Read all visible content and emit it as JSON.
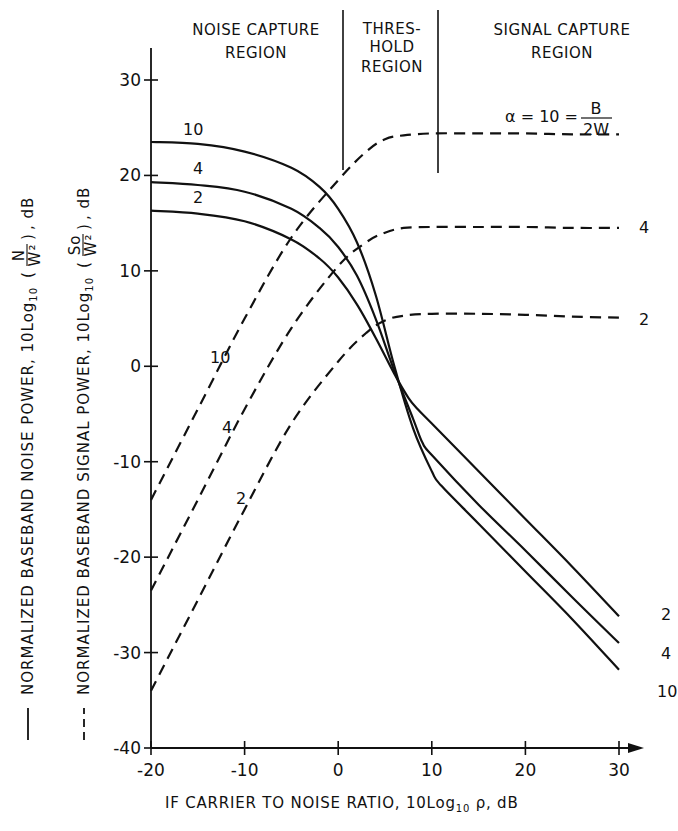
{
  "chart_data": {
    "type": "line",
    "title": "",
    "regions": [
      {
        "name": "noise_capture",
        "label_lines": [
          "NOISE CAPTURE",
          "REGION"
        ],
        "x_range": [
          -20,
          0.5
        ]
      },
      {
        "name": "threshold",
        "label_lines": [
          "THRES-",
          "HOLD",
          "REGION"
        ],
        "x_range": [
          0.5,
          10.5
        ]
      },
      {
        "name": "signal_capture",
        "label_lines": [
          "SIGNAL CAPTURE",
          "REGION"
        ],
        "x_range": [
          10.5,
          30
        ]
      }
    ],
    "xlabel": "IF CARRIER TO NOISE RATIO, 10Log10 ρ, dB",
    "ylabel_solid": "NORMALIZED BASEBAND NOISE POWER, 10Log10 (N/W²), dB",
    "ylabel_dashed": "NORMALIZED BASEBAND SIGNAL POWER, 10Log10 (So/W²), dB",
    "xlim": [
      -20,
      30
    ],
    "ylim": [
      -40,
      30
    ],
    "x_ticks": [
      -20,
      -10,
      0,
      10,
      20,
      30
    ],
    "x_tick_labels": [
      "-20",
      "-10",
      "0",
      "10",
      "20",
      "30"
    ],
    "y_ticks": [
      -40,
      -30,
      -20,
      -10,
      0,
      10,
      20,
      30
    ],
    "y_tick_labels": [
      "-40",
      "-30",
      "-20",
      "-10",
      "0",
      "10",
      "20",
      "30"
    ],
    "grid": false,
    "legend": {
      "solid": "noise power",
      "dashed": "signal power",
      "parameter": "α = 10 = B/2W"
    },
    "series": [
      {
        "name": "noise α=10",
        "style": "solid",
        "label": "10",
        "x": [
          -20,
          -15,
          -10,
          -5,
          -2,
          0,
          2,
          4,
          6,
          8,
          10,
          11,
          15,
          20,
          25,
          30
        ],
        "y": [
          23.5,
          23.3,
          22.5,
          20.8,
          18.8,
          16.5,
          13.0,
          7.5,
          0.0,
          -6.5,
          -11.0,
          -12.5,
          -16.5,
          -21.5,
          -26.5,
          -31.8
        ]
      },
      {
        "name": "noise α=4",
        "style": "solid",
        "label": "4",
        "x": [
          -20,
          -15,
          -10,
          -5,
          -2,
          0,
          2,
          4,
          6,
          8,
          9,
          10,
          15,
          20,
          25,
          30
        ],
        "y": [
          19.3,
          19.0,
          18.3,
          16.5,
          14.5,
          12.5,
          9.5,
          5.0,
          -0.5,
          -5.5,
          -8.0,
          -9.3,
          -14.5,
          -19.3,
          -24.2,
          -29.0
        ]
      },
      {
        "name": "noise α=2",
        "style": "solid",
        "label": "2",
        "x": [
          -20,
          -15,
          -10,
          -5,
          -2,
          0,
          2,
          4,
          6,
          7.5,
          8.5,
          10,
          15,
          20,
          25,
          30
        ],
        "y": [
          16.3,
          16.0,
          15.2,
          13.3,
          11.3,
          9.3,
          6.5,
          3.0,
          -0.8,
          -3.3,
          -4.5,
          -6.0,
          -11.0,
          -16.0,
          -21.0,
          -26.2
        ]
      },
      {
        "name": "signal α=10",
        "style": "dashed",
        "label": "10",
        "end_label": "α = 10 = B/2W",
        "x": [
          -20,
          -15,
          -10,
          -5,
          0,
          3,
          5,
          7,
          10,
          15,
          20,
          25,
          30
        ],
        "y": [
          -14.0,
          -4.5,
          5.0,
          13.5,
          19.5,
          22.5,
          23.8,
          24.2,
          24.4,
          24.4,
          24.4,
          24.3,
          24.3
        ]
      },
      {
        "name": "signal α=4",
        "style": "dashed",
        "label": "4",
        "end_label": "4",
        "x": [
          -20,
          -15,
          -10,
          -5,
          0,
          3,
          5,
          7,
          10,
          15,
          20,
          25,
          30
        ],
        "y": [
          -23.5,
          -14.0,
          -4.5,
          4.0,
          10.5,
          13.0,
          14.0,
          14.5,
          14.6,
          14.6,
          14.6,
          14.5,
          14.5
        ]
      },
      {
        "name": "signal α=2",
        "style": "dashed",
        "label": "2",
        "end_label": "2",
        "x": [
          -20,
          -15,
          -10,
          -5,
          0,
          3,
          5,
          7,
          10,
          15,
          20,
          25,
          30
        ],
        "y": [
          -34.0,
          -24.5,
          -15.0,
          -6.0,
          0.5,
          3.5,
          4.8,
          5.3,
          5.5,
          5.5,
          5.4,
          5.2,
          5.1
        ]
      }
    ]
  },
  "labels": {
    "region_noise": [
      "NOISE CAPTURE",
      "REGION"
    ],
    "region_threshold": [
      "THRES-",
      "HOLD",
      "REGION"
    ],
    "region_signal": [
      "SIGNAL CAPTURE",
      "REGION"
    ],
    "xlabel": "IF CARRIER TO NOISE RATIO, 10Log",
    "xlabel_sub": "10",
    "xlabel_tail": " ρ, dB",
    "ylabel_solid": "NORMALIZED  BASEBAND  NOISE  POWER,  10Log",
    "ylabel_dashed": "NORMALIZED  BASEBAND  SIGNAL  POWER,  10Log",
    "ylabel_sub": "10",
    "ylabel_solid_frac_num": "N",
    "ylabel_dashed_frac_num": "So",
    "ylabel_frac_den": "W²",
    "ylabel_unit": ", dB",
    "alpha_label": "α = 10 = ",
    "alpha_frac_num": "B",
    "alpha_frac_den": "2W"
  }
}
